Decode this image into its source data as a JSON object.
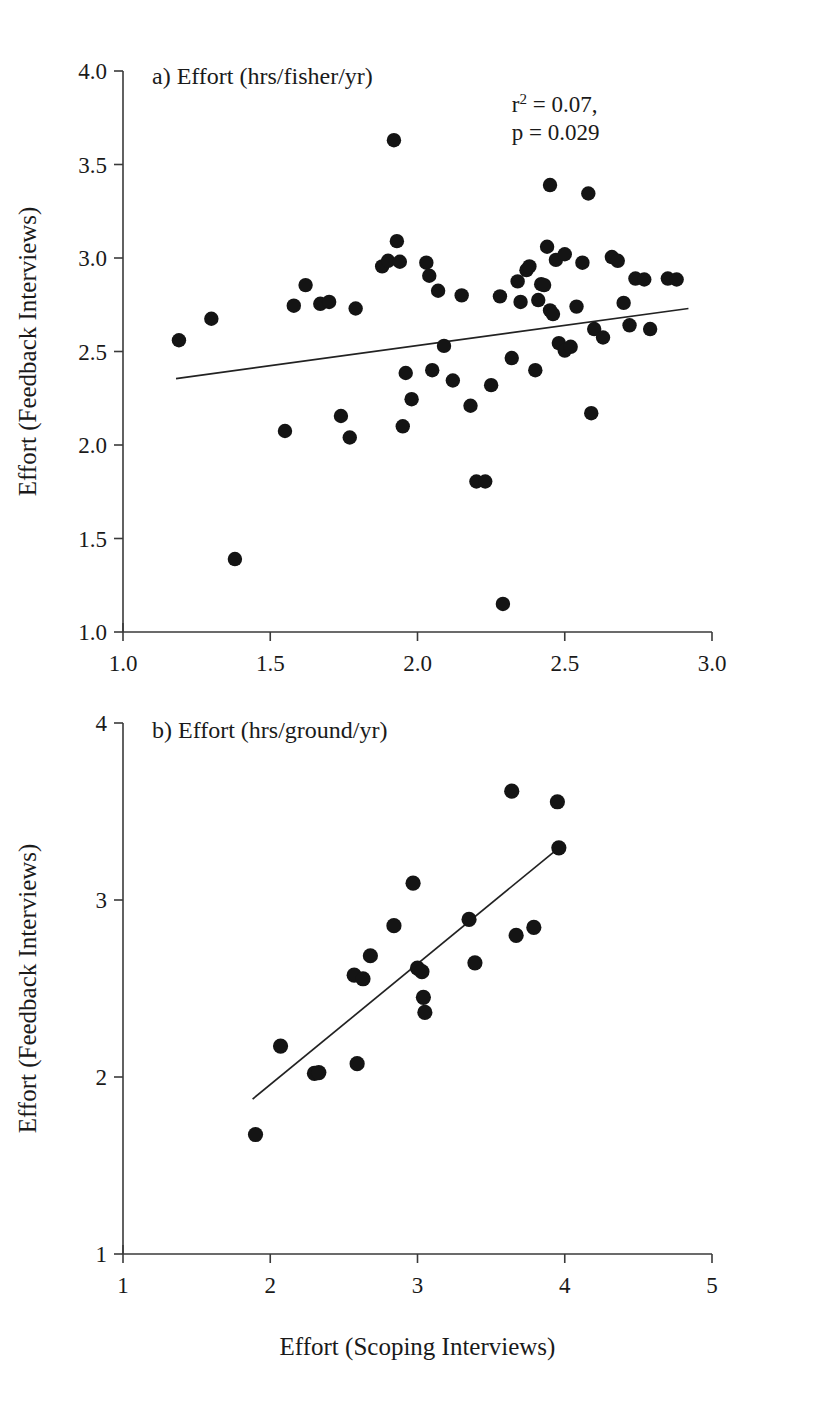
{
  "figure": {
    "shared_xlabel": "Effort (Scoping Interviews)",
    "shared_ylabel": "Effort (Feedback Interviews)"
  },
  "chart_data": [
    {
      "type": "scatter",
      "panel": "a",
      "title": "a) Effort (hrs/fisher/yr)",
      "xlabel": "Effort (Scoping Interviews)",
      "ylabel": "Effort (Feedback Interviews)",
      "xlim": [
        1.0,
        3.0
      ],
      "ylim": [
        1.0,
        4.0
      ],
      "xticks": [
        1.0,
        1.5,
        2.0,
        2.5,
        3.0
      ],
      "xtick_labels": [
        "1.0",
        "1.5",
        "2.0",
        "2.5",
        "3.0"
      ],
      "yticks": [
        1.0,
        1.5,
        2.0,
        2.5,
        3.0,
        3.5,
        4.0
      ],
      "ytick_labels": [
        "1.0",
        "1.5",
        "2.0",
        "2.5",
        "3.0",
        "3.5",
        "4.0"
      ],
      "grid": false,
      "legend": "none",
      "annotations": [
        {
          "text": "r2 = 0.07,",
          "base": "r",
          "sup": "2",
          "rest": " = 0.07,",
          "x": 2.32,
          "y": 3.78
        },
        {
          "text": "p = 0.029",
          "x": 2.32,
          "y": 3.63
        }
      ],
      "trendline": {
        "x": [
          1.18,
          2.92
        ],
        "y": [
          2.355,
          2.73
        ]
      },
      "points": [
        [
          1.19,
          2.56
        ],
        [
          1.3,
          2.675
        ],
        [
          1.38,
          1.39
        ],
        [
          1.55,
          2.075
        ],
        [
          1.58,
          2.745
        ],
        [
          1.62,
          2.855
        ],
        [
          1.67,
          2.755
        ],
        [
          1.7,
          2.765
        ],
        [
          1.74,
          2.155
        ],
        [
          1.77,
          2.04
        ],
        [
          1.79,
          2.73
        ],
        [
          1.88,
          2.955
        ],
        [
          1.9,
          2.985
        ],
        [
          1.92,
          3.63
        ],
        [
          1.93,
          3.09
        ],
        [
          1.94,
          2.98
        ],
        [
          1.95,
          2.1
        ],
        [
          1.96,
          2.385
        ],
        [
          1.98,
          2.245
        ],
        [
          2.03,
          2.975
        ],
        [
          2.04,
          2.905
        ],
        [
          2.05,
          2.4
        ],
        [
          2.07,
          2.825
        ],
        [
          2.09,
          2.53
        ],
        [
          2.12,
          2.345
        ],
        [
          2.15,
          2.8
        ],
        [
          2.18,
          2.21
        ],
        [
          2.2,
          1.805
        ],
        [
          2.23,
          1.805
        ],
        [
          2.25,
          2.32
        ],
        [
          2.28,
          2.795
        ],
        [
          2.29,
          1.15
        ],
        [
          2.32,
          2.465
        ],
        [
          2.34,
          2.875
        ],
        [
          2.35,
          2.765
        ],
        [
          2.37,
          2.935
        ],
        [
          2.38,
          2.955
        ],
        [
          2.4,
          2.4
        ],
        [
          2.41,
          2.775
        ],
        [
          2.42,
          2.86
        ],
        [
          2.43,
          2.855
        ],
        [
          2.44,
          3.06
        ],
        [
          2.45,
          3.39
        ],
        [
          2.45,
          2.72
        ],
        [
          2.46,
          2.7
        ],
        [
          2.47,
          2.99
        ],
        [
          2.48,
          2.545
        ],
        [
          2.5,
          3.02
        ],
        [
          2.5,
          2.505
        ],
        [
          2.52,
          2.525
        ],
        [
          2.54,
          2.74
        ],
        [
          2.56,
          2.975
        ],
        [
          2.58,
          3.345
        ],
        [
          2.59,
          2.17
        ],
        [
          2.6,
          2.62
        ],
        [
          2.63,
          2.575
        ],
        [
          2.66,
          3.005
        ],
        [
          2.68,
          2.985
        ],
        [
          2.7,
          2.76
        ],
        [
          2.72,
          2.64
        ],
        [
          2.74,
          2.89
        ],
        [
          2.77,
          2.885
        ],
        [
          2.79,
          2.62
        ],
        [
          2.85,
          2.89
        ],
        [
          2.88,
          2.885
        ]
      ]
    },
    {
      "type": "scatter",
      "panel": "b",
      "title": "b) Effort (hrs/ground/yr)",
      "xlabel": "Effort (Scoping Interviews)",
      "ylabel": "Effort (Feedback Interviews)",
      "xlim": [
        1,
        5
      ],
      "ylim": [
        1,
        4
      ],
      "xticks": [
        1,
        2,
        3,
        4,
        5
      ],
      "xtick_labels": [
        "1",
        "2",
        "3",
        "4",
        "5"
      ],
      "yticks": [
        1,
        2,
        3,
        4
      ],
      "ytick_labels": [
        "1",
        "2",
        "3",
        "4"
      ],
      "grid": false,
      "legend": "none",
      "trendline": {
        "x": [
          1.88,
          3.96
        ],
        "y": [
          1.875,
          3.295
        ]
      },
      "points": [
        [
          1.9,
          1.675
        ],
        [
          2.07,
          2.175
        ],
        [
          2.3,
          2.02
        ],
        [
          2.33,
          2.025
        ],
        [
          2.57,
          2.575
        ],
        [
          2.59,
          2.075
        ],
        [
          2.63,
          2.555
        ],
        [
          2.68,
          2.685
        ],
        [
          2.84,
          2.855
        ],
        [
          2.97,
          3.095
        ],
        [
          3.0,
          2.615
        ],
        [
          3.03,
          2.595
        ],
        [
          3.04,
          2.45
        ],
        [
          3.05,
          2.365
        ],
        [
          3.35,
          2.89
        ],
        [
          3.39,
          2.645
        ],
        [
          3.64,
          3.615
        ],
        [
          3.67,
          2.8
        ],
        [
          3.79,
          2.845
        ],
        [
          3.95,
          3.555
        ],
        [
          3.96,
          3.295
        ]
      ]
    }
  ]
}
